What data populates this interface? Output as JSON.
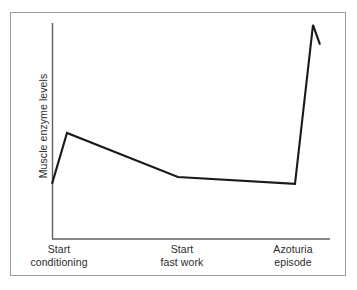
{
  "chart_data": {
    "type": "line",
    "title": "",
    "xlabel": "",
    "ylabel": "Muscle enzyme levels",
    "grid": false,
    "legend": "none",
    "xlim": [
      0,
      100
    ],
    "ylim": [
      0,
      100
    ],
    "axis_ticks_shown": false,
    "axis_values_shown": false,
    "categories": [
      "Start conditioning",
      "Start fast work",
      "Azoturia episode"
    ],
    "category_x": [
      0,
      47,
      90
    ],
    "series": [
      {
        "name": "Muscle enzyme levels",
        "color": "#1a1a1a",
        "x": [
          0,
          5.4,
          45.3,
          87.4,
          93.9,
          96.4
        ],
        "y": [
          25.5,
          49.1,
          28.7,
          25.5,
          99.1,
          90.0
        ],
        "points": [
          {
            "label": "start conditioning baseline",
            "x": 0,
            "y": 25.5
          },
          {
            "label": "early conditioning peak",
            "x": 5.4,
            "y": 49.1
          },
          {
            "label": "decline to start fast work",
            "x": 45.3,
            "y": 28.7
          },
          {
            "label": "plateau before episode",
            "x": 87.4,
            "y": 25.5
          },
          {
            "label": "azoturia episode peak",
            "x": 93.9,
            "y": 99.1
          },
          {
            "label": "post-episode decline",
            "x": 96.4,
            "y": 90.0
          }
        ]
      }
    ]
  },
  "axes": {
    "y_axis_label": "Muscle enzyme levels",
    "x_tick_labels": [
      {
        "line1": "Start",
        "line2": "conditioning"
      },
      {
        "line1": "Start",
        "line2": "fast work"
      },
      {
        "line1": "Azoturia",
        "line2": "episode"
      }
    ]
  },
  "colors": {
    "line": "#1a1a1a",
    "axis": "#5f5f5f",
    "frame": "#9a9a9a",
    "background": "#ffffff",
    "text": "#2b2b2b"
  }
}
